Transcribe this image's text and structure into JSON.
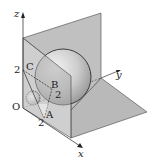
{
  "figure": {
    "axes": {
      "x_label": "x",
      "y_label": "y",
      "z_label": "z"
    },
    "points": {
      "origin": "O",
      "A": "A",
      "B": "B",
      "C": "C"
    },
    "ticks": {
      "x_tick": "2",
      "y_tick": "2",
      "z_tick": "2"
    },
    "colors": {
      "plane_fill": "#b5b5b5",
      "line": "#222222",
      "sphere_light": "#f4f4f4",
      "sphere_dark": "#9a9a9a"
    }
  }
}
